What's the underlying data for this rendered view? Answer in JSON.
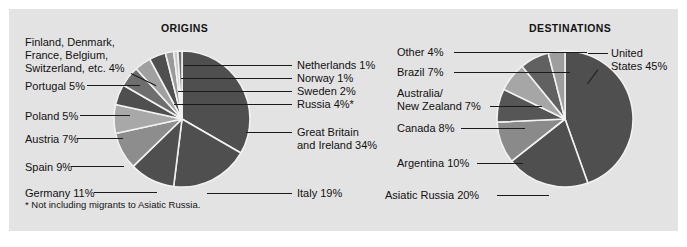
{
  "figure": {
    "background": "#e3e3e3",
    "footnote": "* Not including migrants to Asiatic Russia."
  },
  "chart_data": [
    {
      "type": "pie",
      "title": "ORIGINS",
      "unit": "percent",
      "start_angle_deg": -90,
      "direction": "clockwise",
      "categories": [
        "Great Britain and Ireland",
        "Italy",
        "Germany",
        "Spain",
        "Austria",
        "Poland",
        "Portugal",
        "Finland, Denmark, France, Belgium, Switzerland, etc.",
        "Russia",
        "Sweden",
        "Norway",
        "Netherlands"
      ],
      "values": [
        34,
        19,
        11,
        9,
        7,
        5,
        5,
        4,
        4,
        2,
        1,
        1
      ],
      "colors": [
        "#4f4f4f",
        "#4f4f4f",
        "#4f4f4f",
        "#8d8d8d",
        "#a8a8a8",
        "#4f4f4f",
        "#6e6e6e",
        "#a0a0a0",
        "#4f4f4f",
        "#9a9a9a",
        "#c9c9c9",
        "#6e6e6e"
      ],
      "labels": [
        {
          "text": "Great Britain\nand Ireland 34%",
          "value": 34
        },
        {
          "text": "Italy 19%",
          "value": 19
        },
        {
          "text": "Germany 11%",
          "value": 11
        },
        {
          "text": "Spain 9%",
          "value": 9
        },
        {
          "text": "Austria 7%",
          "value": 7
        },
        {
          "text": "Poland 5%",
          "value": 5
        },
        {
          "text": "Portugal 5%",
          "value": 5
        },
        {
          "text": "Finland, Denmark,\nFrance, Belgium,\nSwitzerland, etc. 4%",
          "value": 4
        },
        {
          "text": "Russia 4%*",
          "value": 4
        },
        {
          "text": "Sweden 2%",
          "value": 2
        },
        {
          "text": "Norway 1%",
          "value": 1
        },
        {
          "text": "Netherlands 1%",
          "value": 1
        }
      ]
    },
    {
      "type": "pie",
      "title": "DESTINATIONS",
      "unit": "percent",
      "start_angle_deg": -90,
      "direction": "clockwise",
      "categories": [
        "United States",
        "Asiatic Russia",
        "Argentina",
        "Canada",
        "Australia/New Zealand",
        "Brazil",
        "Other"
      ],
      "values": [
        45,
        20,
        10,
        8,
        7,
        7,
        4
      ],
      "colors": [
        "#4f4f4f",
        "#4f4f4f",
        "#8a8a8a",
        "#565656",
        "#a6a6a6",
        "#616161",
        "#9e9e9e"
      ],
      "labels": [
        {
          "text": "United\nStates 45%",
          "value": 45
        },
        {
          "text": "Asiatic Russia 20%",
          "value": 20
        },
        {
          "text": "Argentina 10%",
          "value": 10
        },
        {
          "text": "Canada 8%",
          "value": 8
        },
        {
          "text": "Australia/\nNew Zealand 7%",
          "value": 7
        },
        {
          "text": "Brazil 7%",
          "value": 7
        },
        {
          "text": "Other 4%",
          "value": 4
        }
      ]
    }
  ],
  "origins": {
    "title": "ORIGINS",
    "labels_left": [
      {
        "name": "finland-group",
        "text": "Finland, Denmark,\nFrance, Belgium,\nSwitzerland, etc. 4%"
      },
      {
        "name": "portugal",
        "text": "Portugal 5%"
      },
      {
        "name": "poland",
        "text": "Poland 5%"
      },
      {
        "name": "austria",
        "text": "Austria 7%"
      },
      {
        "name": "spain",
        "text": "Spain 9%"
      },
      {
        "name": "germany",
        "text": "Germany 11%"
      }
    ],
    "labels_right": [
      {
        "name": "netherlands",
        "text": "Netherlands 1%"
      },
      {
        "name": "norway",
        "text": "Norway 1%"
      },
      {
        "name": "sweden",
        "text": "Sweden 2%"
      },
      {
        "name": "russia",
        "text": "Russia 4%*"
      },
      {
        "name": "great-britain",
        "text": "Great Britain\nand Ireland 34%"
      },
      {
        "name": "italy",
        "text": "Italy 19%"
      }
    ]
  },
  "destinations": {
    "title": "DESTINATIONS",
    "labels_left": [
      {
        "name": "other",
        "text": "Other 4%"
      },
      {
        "name": "brazil",
        "text": "Brazil 7%"
      },
      {
        "name": "australia-nz",
        "text": "Australia/\nNew Zealand 7%"
      },
      {
        "name": "canada",
        "text": "Canada 8%"
      },
      {
        "name": "argentina",
        "text": "Argentina 10%"
      },
      {
        "name": "asiatic-russia",
        "text": "Asiatic Russia 20%"
      }
    ],
    "labels_right": [
      {
        "name": "united-states",
        "text": "United\nStates 45%"
      }
    ]
  }
}
